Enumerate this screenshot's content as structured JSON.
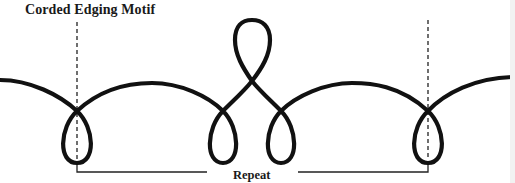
{
  "diagram": {
    "title": "Corded Edging Motif",
    "repeat_label": "Repeat",
    "colors": {
      "cord": "#111111",
      "guide": "#222222",
      "background": "#ffffff"
    },
    "elements": {
      "cord_path": "continuous looped cord line",
      "guide_lines": [
        "left-repeat-boundary",
        "right-repeat-boundary"
      ],
      "loops": [
        "left-bottom-loop",
        "center-left-bottom-loop",
        "top-center-loop",
        "center-right-bottom-loop",
        "right-bottom-loop"
      ],
      "bracket": "repeat-bracket"
    }
  }
}
